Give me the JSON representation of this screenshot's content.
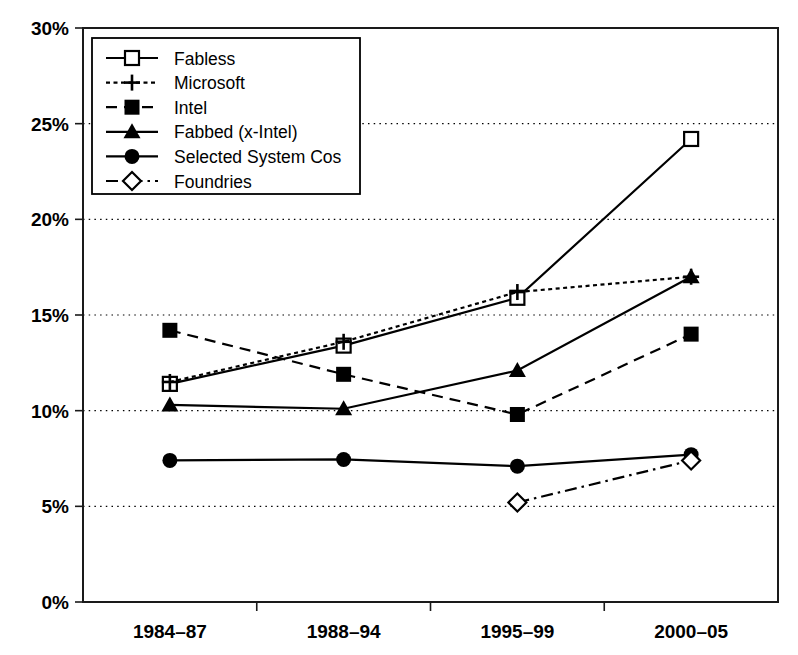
{
  "chart_data": {
    "type": "line",
    "title": "",
    "xlabel": "",
    "ylabel": "",
    "categories": [
      "1984–87",
      "1988–94",
      "1995–99",
      "2000–05"
    ],
    "ytick_labels": [
      "0%",
      "5%",
      "10%",
      "15%",
      "20%",
      "25%",
      "30%"
    ],
    "ytick_values": [
      0,
      5,
      10,
      15,
      20,
      25,
      30
    ],
    "ylim": [
      0,
      30
    ],
    "grid": true,
    "legend_position": "top-left",
    "value_suffix": "%",
    "series": [
      {
        "name": "Fabless",
        "marker": "open-square",
        "linestyle": "solid",
        "color": "#000000",
        "values": [
          11.4,
          13.4,
          15.9,
          24.2
        ]
      },
      {
        "name": "Microsoft",
        "marker": "plus",
        "linestyle": "dotted",
        "color": "#000000",
        "values": [
          11.5,
          13.6,
          16.2,
          17.0
        ]
      },
      {
        "name": "Intel",
        "marker": "filled-square",
        "linestyle": "dashed",
        "color": "#000000",
        "values": [
          14.2,
          11.9,
          9.8,
          14.0
        ]
      },
      {
        "name": "Fabbed (x-Intel)",
        "marker": "filled-triangle",
        "linestyle": "solid",
        "color": "#000000",
        "values": [
          10.3,
          10.1,
          12.1,
          17.0
        ]
      },
      {
        "name": "Selected System Cos",
        "marker": "filled-circle",
        "linestyle": "solid",
        "color": "#000000",
        "values": [
          7.4,
          7.45,
          7.1,
          7.7
        ]
      },
      {
        "name": "Foundries",
        "marker": "open-diamond",
        "linestyle": "dashdot",
        "color": "#000000",
        "values": [
          null,
          null,
          5.2,
          7.4
        ]
      }
    ]
  }
}
